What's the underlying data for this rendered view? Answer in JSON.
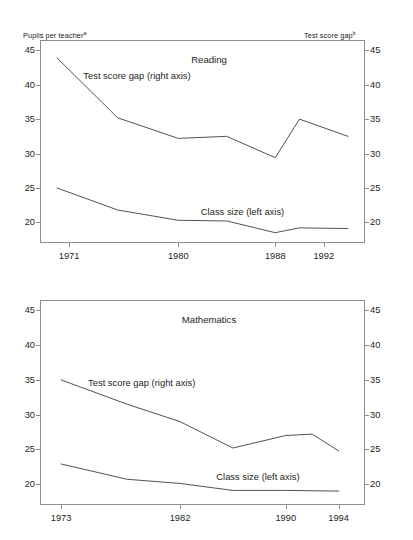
{
  "axis_captions": {
    "left": "Pupils per teacher",
    "left_note": "a",
    "right": "Test score gap",
    "right_note": "b"
  },
  "colors": {
    "line": "#3f3f3f",
    "frame": "#8e8e8e",
    "text": "#231f20",
    "background": "#ffffff"
  },
  "chart_data": [
    {
      "type": "line",
      "title": "Reading",
      "xlabel": "",
      "ylabel": "Pupils per teacher",
      "y2label": "Test score gap",
      "ylim": [
        17.0,
        46.5
      ],
      "y2lim": [
        17.0,
        46.5
      ],
      "xlim": [
        1968.6,
        1995.4
      ],
      "grid": false,
      "legend": "in-plot annotations",
      "yticks": [
        45,
        40,
        35,
        30,
        25,
        20
      ],
      "y2ticks": [
        45,
        40,
        35,
        30,
        25,
        20
      ],
      "xticks": [
        1971,
        1980,
        1988,
        1992
      ],
      "xticklabels": [
        "1971",
        "1980",
        "1988",
        "1992"
      ],
      "annotations": [
        {
          "text": "Test score gap (right axis)",
          "x": 1976.6,
          "y": 41.4
        },
        {
          "text": "Class size (left axis)",
          "x": 1985.3,
          "y": 21.6
        }
      ],
      "series": [
        {
          "name": "Test score gap (right axis)",
          "axis": "right",
          "x": [
            1970,
            1975,
            1980,
            1984,
            1988,
            1990,
            1994
          ],
          "values": [
            43.9,
            35.2,
            32.2,
            32.5,
            29.4,
            35.0,
            32.5
          ]
        },
        {
          "name": "Class size (left axis)",
          "axis": "left",
          "x": [
            1970,
            1975,
            1980,
            1984,
            1988,
            1990,
            1994
          ],
          "values": [
            25.0,
            21.8,
            20.3,
            20.2,
            18.5,
            19.2,
            19.1
          ]
        }
      ]
    },
    {
      "type": "line",
      "title": "Mathematics",
      "xlabel": "",
      "ylabel": "Pupils per teacher",
      "y2label": "Test score gap",
      "ylim": [
        17.0,
        46.5
      ],
      "y2lim": [
        17.0,
        46.5
      ],
      "xlim": [
        1971.4,
        1996.0
      ],
      "grid": false,
      "legend": "in-plot annotations",
      "yticks": [
        45,
        40,
        35,
        30,
        25,
        20
      ],
      "y2ticks": [
        45,
        40,
        35,
        30,
        25,
        20
      ],
      "xticks": [
        1973,
        1982,
        1990,
        1994
      ],
      "xticklabels": [
        "1973",
        "1982",
        "1990",
        "1994"
      ],
      "annotations": [
        {
          "text": "Test score gap (right axis)",
          "x": 1979.1,
          "y": 34.7
        },
        {
          "text": "Class size (left axis)",
          "x": 1987.9,
          "y": 21.2
        }
      ],
      "series": [
        {
          "name": "Test score gap (right axis)",
          "axis": "right",
          "x": [
            1973,
            1978,
            1982,
            1986,
            1990,
            1992,
            1994
          ],
          "values": [
            35.0,
            31.5,
            29.0,
            25.2,
            27.0,
            27.2,
            24.8
          ]
        },
        {
          "name": "Class size (left axis)",
          "axis": "left",
          "x": [
            1973,
            1978,
            1982,
            1986,
            1990,
            1994
          ],
          "values": [
            22.9,
            20.7,
            20.1,
            19.1,
            19.1,
            19.0
          ]
        }
      ]
    }
  ]
}
